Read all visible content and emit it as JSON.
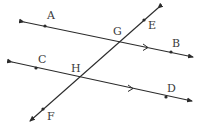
{
  "diagram": {
    "stroke_color": "#2b2b2b",
    "label_color": "#3a3a3a",
    "lines": [
      {
        "name": "AB",
        "x1": 24,
        "y1": 22,
        "x2": 193,
        "y2": 57
      },
      {
        "name": "CD",
        "x1": 12,
        "y1": 62,
        "x2": 192,
        "y2": 101
      },
      {
        "name": "EF",
        "x1": 158,
        "y1": 8,
        "x2": 30,
        "y2": 121
      }
    ],
    "points": [
      {
        "label": "A",
        "x": 45,
        "y": 26,
        "lx": 47,
        "ly": 19
      },
      {
        "label": "B",
        "x": 171,
        "y": 52,
        "lx": 172,
        "ly": 47
      },
      {
        "label": "C",
        "x": 36,
        "y": 68,
        "lx": 38,
        "ly": 63
      },
      {
        "label": "D",
        "x": 166,
        "y": 97,
        "lx": 167,
        "ly": 92
      },
      {
        "label": "E",
        "x": 144,
        "y": 20,
        "lx": 148,
        "ly": 29
      },
      {
        "label": "F",
        "x": 43,
        "y": 109,
        "lx": 47,
        "ly": 120
      },
      {
        "label": "G",
        "x": 120,
        "y": 41,
        "lx": 113,
        "ly": 35
      },
      {
        "label": "H",
        "x": 79,
        "y": 78,
        "lx": 71,
        "ly": 72
      }
    ],
    "labels": {
      "A": "A",
      "B": "B",
      "C": "C",
      "D": "D",
      "E": "E",
      "F": "F",
      "G": "G",
      "H": "H"
    }
  }
}
